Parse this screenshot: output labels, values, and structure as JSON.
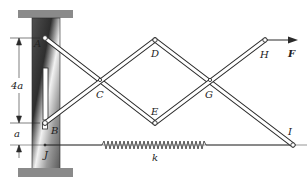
{
  "diagram": {
    "type": "mechanism",
    "points": {
      "A": {
        "label": "A",
        "x": 45,
        "y": 38
      },
      "B": {
        "label": "B",
        "x": 45,
        "y": 123
      },
      "C": {
        "label": "C",
        "x": 100,
        "y": 80
      },
      "D": {
        "label": "D",
        "x": 155,
        "y": 40
      },
      "E": {
        "label": "E",
        "x": 155,
        "y": 123
      },
      "G": {
        "label": "G",
        "x": 210,
        "y": 80
      },
      "H": {
        "label": "H",
        "x": 265,
        "y": 40
      },
      "I": {
        "label": "I",
        "x": 293,
        "y": 145
      },
      "J": {
        "label": "J",
        "x": 45,
        "y": 145
      }
    },
    "labels": {
      "A": "A",
      "B": "B",
      "C": "C",
      "D": "D",
      "E": "E",
      "G": "G",
      "H": "H",
      "I": "I",
      "J": "J",
      "force": "F",
      "spring": "k",
      "dim_large": "4a",
      "dim_small": "a"
    },
    "colors": {
      "line": "#2a2a2a",
      "bar_fill": "#ffffff",
      "cap": "#8a8a8a",
      "column_dark": "#3a3a3a",
      "column_light": "#e8e8e8"
    }
  }
}
